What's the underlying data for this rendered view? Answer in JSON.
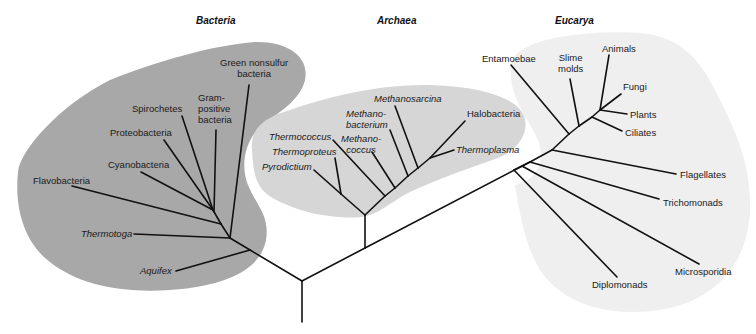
{
  "diagram": {
    "type": "phylogenetic-tree",
    "colors": {
      "bacteria_region": "#a8a8a8",
      "archaea_region": "#d6d6d6",
      "eucarya_region": "#efefef",
      "branch": "#111111"
    },
    "domains": [
      {
        "name": "Bacteria"
      },
      {
        "name": "Archaea"
      },
      {
        "name": "Eucarya"
      }
    ],
    "bacteria": {
      "title": "Bacteria",
      "taxa": [
        {
          "label": "Green nonsulfur",
          "label2": "bacteria"
        },
        {
          "label": "Gram-",
          "label2": "positive",
          "label3": "bacteria"
        },
        {
          "label": "Spirochetes"
        },
        {
          "label": "Proteobacteria"
        },
        {
          "label": "Cyanobacteria"
        },
        {
          "label": "Flavobacteria"
        },
        {
          "label": "Thermotoga"
        },
        {
          "label": "Aquifex"
        }
      ]
    },
    "archaea": {
      "title": "Archaea",
      "taxa": [
        {
          "label": "Methanosarcina"
        },
        {
          "label": "Methano-",
          "label2": "bacterium"
        },
        {
          "label": "Halobacteria"
        },
        {
          "label": "Thermococcus"
        },
        {
          "label": "Methano-",
          "label2": "coccus"
        },
        {
          "label": "Thermoproteus"
        },
        {
          "label": "Thermoplasma"
        },
        {
          "label": "Pyrodictium"
        }
      ]
    },
    "eucarya": {
      "title": "Eucarya",
      "taxa": [
        {
          "label": "Entamoebae"
        },
        {
          "label": "Slime",
          "label2": "molds"
        },
        {
          "label": "Animals"
        },
        {
          "label": "Fungi"
        },
        {
          "label": "Plants"
        },
        {
          "label": "Ciliates"
        },
        {
          "label": "Flagellates"
        },
        {
          "label": "Trichomonads"
        },
        {
          "label": "Microsporidia"
        },
        {
          "label": "Diplomonads"
        }
      ]
    }
  }
}
